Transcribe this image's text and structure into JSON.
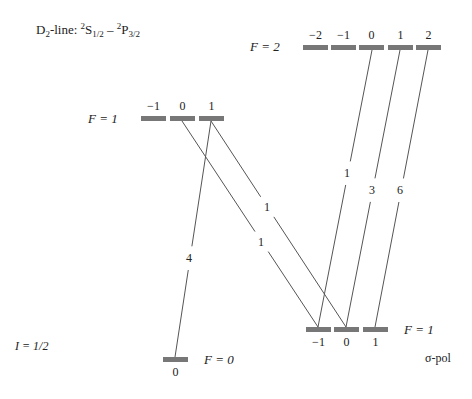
{
  "title": {
    "prefix": "D",
    "prefix_sub": "2",
    "suffix": "-line: ",
    "lower_state": {
      "sup": "2",
      "base": "S",
      "sub": "1/2"
    },
    "dash": " – ",
    "upper_state": {
      "sup": "2",
      "base": "P",
      "sub": "3/2"
    }
  },
  "nuclear_spin_label": "I = 1/2",
  "polarization_label": "σ-pol",
  "levels": {
    "upper_F2": {
      "label": "F = 2",
      "m_labels": [
        "−2",
        "−1",
        "0",
        "1",
        "2"
      ],
      "bars_x": [
        303,
        331,
        359,
        388,
        416
      ],
      "y": 45
    },
    "upper_F1": {
      "label": "F = 1",
      "m_labels": [
        "−1",
        "0",
        "1"
      ],
      "bars_x": [
        141,
        170,
        199
      ],
      "y": 116
    },
    "lower_F1": {
      "label": "F = 1",
      "m_labels": [
        "−1",
        "0",
        "1"
      ],
      "bars_x": [
        306,
        334,
        363
      ],
      "y": 327
    },
    "lower_F0": {
      "label": "F = 0",
      "m_labels": [
        "0"
      ],
      "bars_x": [
        163
      ],
      "y": 357
    }
  },
  "transitions": [
    {
      "from": "upper_F1 m=1",
      "to": "lower_F0 m=0",
      "strength": "4",
      "x1": 211,
      "y1": 121,
      "x2": 175,
      "y2": 357,
      "lx": 189,
      "ly": 262
    },
    {
      "from": "upper_F1 m=0",
      "to": "lower_F1 m=-1",
      "strength": "1",
      "x1": 182,
      "y1": 121,
      "x2": 318,
      "y2": 327,
      "lx": 261,
      "ly": 246
    },
    {
      "from": "upper_F1 m=1",
      "to": "lower_F1 m=0",
      "strength": "1",
      "x1": 211,
      "y1": 121,
      "x2": 346,
      "y2": 327,
      "lx": 267,
      "ly": 211
    },
    {
      "from": "upper_F2 m=0",
      "to": "lower_F1 m=-1",
      "strength": "1",
      "x1": 372,
      "y1": 50,
      "x2": 318,
      "y2": 327,
      "lx": 347,
      "ly": 177
    },
    {
      "from": "upper_F2 m=1",
      "to": "lower_F1 m=0",
      "strength": "3",
      "x1": 400,
      "y1": 50,
      "x2": 346,
      "y2": 327,
      "lx": 372,
      "ly": 194
    },
    {
      "from": "upper_F2 m=2",
      "to": "lower_F1 m=1",
      "strength": "6",
      "x1": 428,
      "y1": 50,
      "x2": 375,
      "y2": 327,
      "lx": 400,
      "ly": 194
    }
  ],
  "colors": {
    "bar": "#777777",
    "line": "#555555",
    "text": "#222222"
  }
}
